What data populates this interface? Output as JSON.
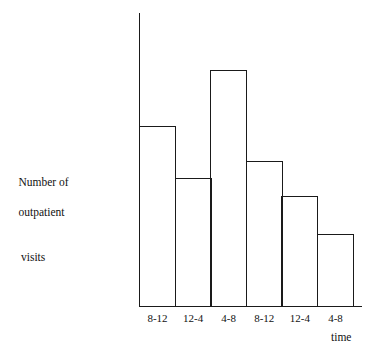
{
  "chart_data": {
    "type": "bar",
    "title": "",
    "subtitle": "",
    "xlabel": "time",
    "ylabel": "Number of\noutpatient\nvisits",
    "ylabel_lines": [
      "Number of",
      "outpatient",
      "visits"
    ],
    "categories": [
      "8-12",
      "12-4",
      "4-8",
      "8-12",
      "12-4",
      "4-8"
    ],
    "values": [
      62,
      44,
      81,
      50,
      38,
      25
    ],
    "ylim": [
      0,
      100
    ],
    "xlim": [
      0,
      6
    ],
    "grid": false,
    "legend": false,
    "legend_position": "none",
    "y_tick_labels": [],
    "x_tick_labels": [
      "8-12",
      "12-4",
      "4-8",
      "8-12",
      "12-4",
      "4-8"
    ],
    "annotations": [],
    "bar_style": "unfilled-outline-adjacent",
    "colors": {
      "background": "#ffffff",
      "axis": "#1a1a1a",
      "bar_outline": "#1a1a1a",
      "bar_fill": "transparent",
      "text": "#111111"
    }
  }
}
